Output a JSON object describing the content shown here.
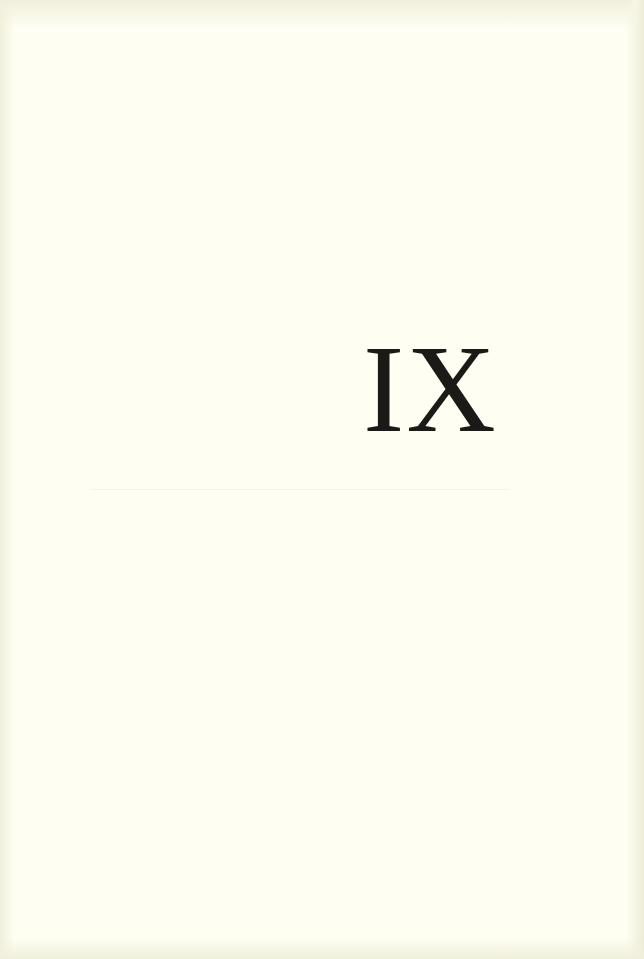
{
  "page": {
    "chapter_numeral": "IX",
    "background_color": "#fefef2",
    "text_color": "#1c1a17"
  }
}
